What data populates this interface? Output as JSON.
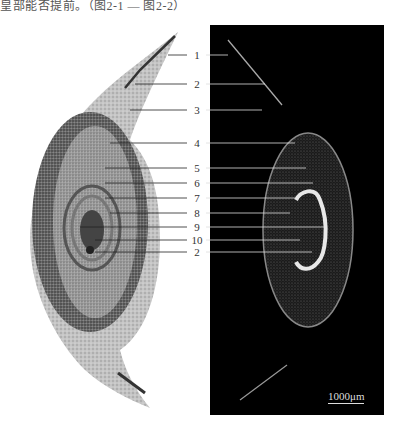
{
  "caption_fragment": "皇部能否提前。（图2-1 — 图2-2）",
  "figure": {
    "left_panel": {
      "type": "light-microscopy-section",
      "background": "#ffffff",
      "tissue_color": "#b8b8b8"
    },
    "right_panel": {
      "type": "fluorescence-section",
      "background": "#000000",
      "signal_color": "#e0e0e0"
    },
    "labels": [
      {
        "id": "1",
        "y": 55
      },
      {
        "id": "2",
        "y": 84
      },
      {
        "id": "3",
        "y": 110
      },
      {
        "id": "4",
        "y": 143
      },
      {
        "id": "5",
        "y": 168
      },
      {
        "id": "6",
        "y": 183
      },
      {
        "id": "7",
        "y": 198
      },
      {
        "id": "8",
        "y": 213
      },
      {
        "id": "9",
        "y": 227
      },
      {
        "id": "10",
        "y": 240
      },
      {
        "id": "2",
        "y": 252
      }
    ],
    "scale_bar": {
      "label": "1000μm"
    }
  }
}
